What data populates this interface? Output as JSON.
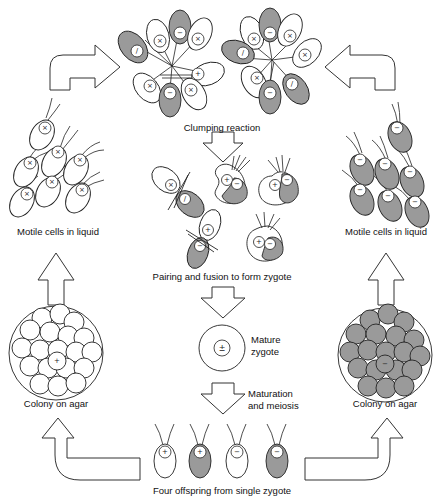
{
  "diagram": {
    "labels": {
      "clumping": "Clumping reaction",
      "pairing": "Pairing and fusion to form zygote",
      "mature_zygote_line1": "Mature",
      "mature_zygote_line2": "zygote",
      "maturation_line1": "Maturation",
      "maturation_line2": "and meiosis",
      "offspring": "Four offspring from single zygote",
      "motile_left": "Motile cells in liquid",
      "motile_right": "Motile cells in liquid",
      "colony_left": "Colony on agar",
      "colony_right": "Colony on agar"
    },
    "symbols": {
      "plus": "+",
      "minus": "−",
      "plus_minus": "±",
      "cross": "×"
    },
    "offspring": [
      {
        "mating_type": "+",
        "shaded": false
      },
      {
        "mating_type": "+",
        "shaded": true
      },
      {
        "mating_type": "−",
        "shaded": false
      },
      {
        "mating_type": "−",
        "shaded": true
      }
    ],
    "colors": {
      "shaded_cell": "#9a9a9a",
      "outline": "#222222",
      "background": "#ffffff"
    }
  }
}
